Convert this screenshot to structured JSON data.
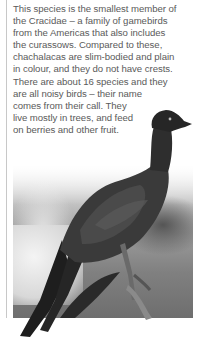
{
  "page": {
    "paragraph_lines": [
      "This species is the smallest member of",
      "the Cracidae – a family of gamebirds",
      "from the Americas that also includes",
      "the curassows. Compared to these,",
      "chachalacas are slim-bodied and plain",
      "in colour, and they do not have crests.",
      "There are about 16 species and they",
      "are all noisy birds – their name",
      "comes from their call. They",
      "live mostly in trees, and feed",
      "on berries and other fruit."
    ]
  },
  "photo": {
    "subject": "chachalaca-bird",
    "style": "grayscale"
  },
  "colors": {
    "text": "#5a5a5a",
    "rule": "#c8c8c8"
  }
}
